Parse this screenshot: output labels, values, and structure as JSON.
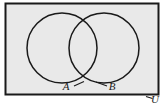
{
  "figure": {
    "type": "venn-diagram",
    "background_color": "#ffffff",
    "universe": {
      "label": "U",
      "fill_color": "#e9e9e9",
      "border_color": "#1a1a1a",
      "rect": {
        "x": 5,
        "y": 3,
        "width": 154,
        "height": 92
      },
      "label_position": {
        "x": 154,
        "y": 102
      }
    },
    "sets": [
      {
        "label": "A",
        "center": {
          "x": 62,
          "y": 48
        },
        "radius": 35,
        "stroke_color": "#1a1a1a",
        "label_position": {
          "x": 67,
          "y": 89
        },
        "leader_from": {
          "x": 72,
          "y": 86
        },
        "leader_to": {
          "x": 83,
          "y": 81
        }
      },
      {
        "label": "B",
        "center": {
          "x": 104,
          "y": 48
        },
        "radius": 35,
        "stroke_color": "#1a1a1a",
        "label_position": {
          "x": 110,
          "y": 89
        },
        "leader_from": {
          "x": 108,
          "y": 86
        },
        "leader_to": {
          "x": 96,
          "y": 82
        }
      }
    ],
    "universe_leader": {
      "from": {
        "x": 140,
        "y": 95
      },
      "to": {
        "x": 152,
        "y": 99
      }
    }
  }
}
